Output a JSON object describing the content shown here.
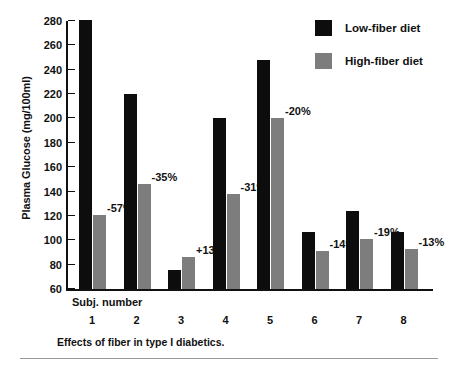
{
  "chart_data": {
    "type": "bar",
    "title": "",
    "caption": "Effects of fiber in type I diabetics.",
    "xlabel": "Subj. number",
    "ylabel": "Plasma Glucose (mg/100ml)",
    "categories": [
      "1",
      "2",
      "3",
      "4",
      "5",
      "6",
      "7",
      "8"
    ],
    "ylim": [
      60,
      280
    ],
    "yticks": [
      60,
      80,
      100,
      120,
      140,
      160,
      180,
      200,
      220,
      240,
      260,
      280
    ],
    "ytick_labels": [
      "60",
      "80",
      "100",
      "120",
      "140",
      "160",
      "180",
      "200",
      "220",
      "240",
      "260",
      "280"
    ],
    "grid": false,
    "legend_position": "top-right",
    "series": [
      {
        "name": "Low-fiber diet",
        "color": "#0d0d0d",
        "values": [
          281,
          220,
          76,
          200,
          248,
          107,
          124,
          107
        ]
      },
      {
        "name": "High-fiber diet",
        "color": "#7d7d7d",
        "values": [
          121,
          146,
          86,
          138,
          200,
          91,
          101,
          93
        ]
      }
    ],
    "annotations": [
      {
        "category": "1",
        "text": "-57%",
        "value": -57
      },
      {
        "category": "2",
        "text": "-35%",
        "value": -35
      },
      {
        "category": "3",
        "text": "+13%",
        "value": 13
      },
      {
        "category": "4",
        "text": "-31%",
        "value": -31
      },
      {
        "category": "5",
        "text": "-20%",
        "value": -20
      },
      {
        "category": "6",
        "text": "-14%",
        "value": -14
      },
      {
        "category": "7",
        "text": "-19%",
        "value": -19
      },
      {
        "category": "8",
        "text": "-13%",
        "value": -13
      }
    ]
  },
  "legend": {
    "items": [
      {
        "label": "Low-fiber diet",
        "color": "#0d0d0d"
      },
      {
        "label": "High-fiber diet",
        "color": "#7d7d7d"
      }
    ]
  }
}
